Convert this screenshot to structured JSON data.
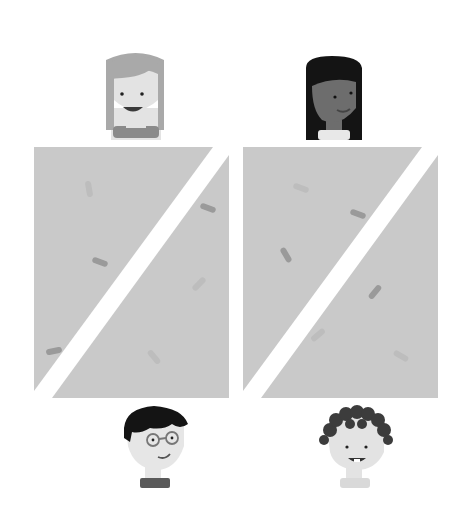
{
  "scene": {
    "description": "Illustration of four people with two gray panels split by white diagonal stripes, with scattered rod-shaped particles",
    "background": "#ffffff",
    "panel_color": "#c9c9c9",
    "stripe_color": "#ffffff",
    "rod_dark": "#9a9a9a",
    "rod_light": "#bdbdbd"
  },
  "people": [
    {
      "id": "top-left",
      "description": "girl with light gray hair, smiling open mouth",
      "hair": "#a9a9a9",
      "skin": "#e3e3e3",
      "shirt": "#8a8a8a"
    },
    {
      "id": "top-right",
      "description": "girl with long black hair, darker skin",
      "hair": "#141414",
      "skin": "#6d6d6d",
      "shirt": "#e8e8e8"
    },
    {
      "id": "bottom-left",
      "description": "boy with black hair and round glasses",
      "hair": "#141414",
      "skin": "#e6e6e6",
      "shirt": "#5a5a5a"
    },
    {
      "id": "bottom-right",
      "description": "boy with curly dark hair, smiling with teeth",
      "hair": "#3c3c3c",
      "skin": "#e3e3e3",
      "shirt": "#d9d9d9"
    }
  ],
  "panels": [
    {
      "id": "left",
      "rods": [
        {
          "x": 89,
          "y": 189,
          "angle": 80,
          "shade": "light"
        },
        {
          "x": 208,
          "y": 208,
          "angle": 20,
          "shade": "dark"
        },
        {
          "x": 100,
          "y": 262,
          "angle": 20,
          "shade": "dark"
        },
        {
          "x": 199,
          "y": 284,
          "angle": -45,
          "shade": "light"
        },
        {
          "x": 54,
          "y": 351,
          "angle": -12,
          "shade": "dark"
        },
        {
          "x": 154,
          "y": 357,
          "angle": 50,
          "shade": "light"
        }
      ]
    },
    {
      "id": "right",
      "rods": [
        {
          "x": 301,
          "y": 188,
          "angle": 20,
          "shade": "light"
        },
        {
          "x": 358,
          "y": 214,
          "angle": 20,
          "shade": "dark"
        },
        {
          "x": 286,
          "y": 255,
          "angle": 60,
          "shade": "dark"
        },
        {
          "x": 375,
          "y": 292,
          "angle": -50,
          "shade": "dark"
        },
        {
          "x": 318,
          "y": 335,
          "angle": -40,
          "shade": "light"
        },
        {
          "x": 401,
          "y": 356,
          "angle": 30,
          "shade": "light"
        }
      ]
    }
  ]
}
